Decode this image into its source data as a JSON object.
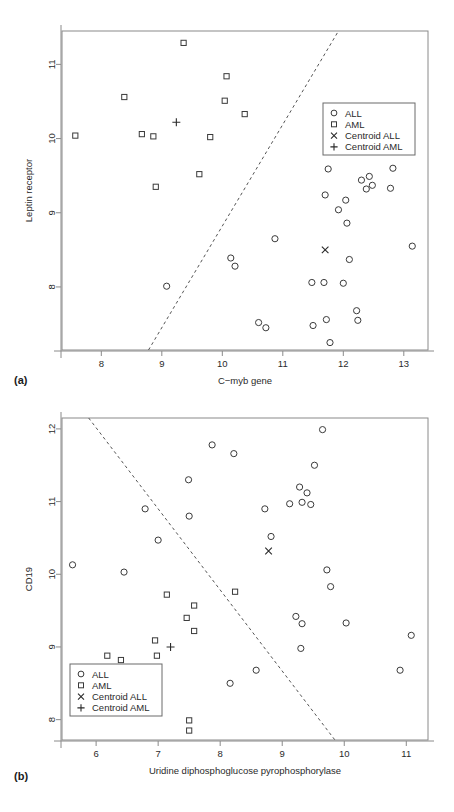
{
  "figure": {
    "panel_a_label": "(a)",
    "panel_b_label": "(b)"
  },
  "legend": {
    "items": [
      {
        "symbol": "circle",
        "label": "ALL"
      },
      {
        "symbol": "square",
        "label": "AML"
      },
      {
        "symbol": "cross",
        "label": "Centroid ALL"
      },
      {
        "symbol": "plus",
        "label": "Centroid AML"
      }
    ]
  },
  "colors": {
    "point_stroke": "#3a3a3a",
    "frame": "#8a8a8a",
    "boundary": "#555555",
    "text": "#2a2a2a"
  },
  "chart_data": [
    {
      "type": "scatter",
      "panel": "(a)",
      "title": "",
      "xlabel": "C−myb gene",
      "ylabel": "Leptin receptor",
      "xlim": [
        7.35,
        13.4
      ],
      "ylim": [
        7.15,
        11.45
      ],
      "xticks": [
        8,
        9,
        10,
        11,
        12,
        13
      ],
      "yticks": [
        8,
        9,
        10,
        11
      ],
      "grid": false,
      "legend_position": "top-right",
      "series": [
        {
          "name": "ALL",
          "symbol": "circle",
          "points": [
            [
              9.08,
              8.01
            ],
            [
              10.14,
              8.39
            ],
            [
              10.21,
              8.28
            ],
            [
              10.6,
              7.52
            ],
            [
              10.72,
              7.45
            ],
            [
              10.87,
              8.65
            ],
            [
              11.48,
              8.06
            ],
            [
              11.5,
              7.48
            ],
            [
              11.68,
              8.06
            ],
            [
              11.72,
              7.56
            ],
            [
              11.75,
              9.59
            ],
            [
              11.7,
              9.24
            ],
            [
              11.78,
              7.25
            ],
            [
              11.92,
              9.04
            ],
            [
              12.0,
              8.05
            ],
            [
              12.04,
              9.17
            ],
            [
              12.06,
              8.86
            ],
            [
              12.1,
              8.37
            ],
            [
              12.22,
              7.68
            ],
            [
              12.24,
              7.55
            ],
            [
              12.3,
              9.44
            ],
            [
              12.38,
              9.32
            ],
            [
              12.43,
              9.49
            ],
            [
              12.48,
              9.37
            ],
            [
              12.78,
              9.33
            ],
            [
              12.82,
              9.6
            ],
            [
              13.14,
              8.55
            ]
          ]
        },
        {
          "name": "AML",
          "symbol": "square",
          "points": [
            [
              7.57,
              10.04
            ],
            [
              8.38,
              10.56
            ],
            [
              8.67,
              10.06
            ],
            [
              8.86,
              10.03
            ],
            [
              8.9,
              9.35
            ],
            [
              9.36,
              11.29
            ],
            [
              9.62,
              9.52
            ],
            [
              9.8,
              10.02
            ],
            [
              10.04,
              10.51
            ],
            [
              10.07,
              10.84
            ],
            [
              10.37,
              10.33
            ]
          ]
        },
        {
          "name": "Centroid ALL",
          "symbol": "cross",
          "points": [
            [
              11.7,
              8.5
            ]
          ]
        },
        {
          "name": "Centroid AML",
          "symbol": "plus",
          "points": [
            [
              9.24,
              10.22
            ]
          ]
        }
      ],
      "decision_boundary": {
        "style": "dashed",
        "x": [
          8.78,
          11.92
        ],
        "y": [
          7.15,
          11.45
        ]
      }
    },
    {
      "type": "scatter",
      "panel": "(b)",
      "title": "",
      "xlabel": "Uridine diphosphoglucose pyrophosphorylase",
      "ylabel": "CD19",
      "xlim": [
        5.45,
        11.35
      ],
      "ylim": [
        7.72,
        12.15
      ],
      "xticks": [
        6,
        7,
        8,
        9,
        10,
        11
      ],
      "yticks": [
        8,
        9,
        10,
        11,
        12
      ],
      "grid": false,
      "legend_position": "bottom-left",
      "series": [
        {
          "name": "ALL",
          "symbol": "circle",
          "points": [
            [
              5.62,
              10.13
            ],
            [
              6.45,
              10.03
            ],
            [
              6.79,
              10.9
            ],
            [
              7.0,
              10.47
            ],
            [
              7.49,
              11.3
            ],
            [
              7.5,
              10.8
            ],
            [
              7.87,
              11.78
            ],
            [
              8.16,
              8.5
            ],
            [
              8.22,
              11.66
            ],
            [
              8.58,
              8.68
            ],
            [
              8.72,
              10.9
            ],
            [
              8.82,
              10.52
            ],
            [
              9.12,
              10.97
            ],
            [
              9.22,
              9.42
            ],
            [
              9.28,
              11.2
            ],
            [
              9.32,
              10.99
            ],
            [
              9.32,
              9.32
            ],
            [
              9.3,
              8.98
            ],
            [
              9.4,
              11.12
            ],
            [
              9.46,
              10.96
            ],
            [
              9.52,
              11.5
            ],
            [
              9.65,
              11.99
            ],
            [
              9.72,
              10.06
            ],
            [
              9.78,
              9.83
            ],
            [
              10.03,
              9.33
            ],
            [
              10.9,
              8.68
            ],
            [
              11.08,
              9.16
            ]
          ]
        },
        {
          "name": "AML",
          "symbol": "square",
          "points": [
            [
              6.18,
              8.88
            ],
            [
              6.4,
              8.82
            ],
            [
              6.95,
              9.09
            ],
            [
              6.98,
              8.88
            ],
            [
              7.14,
              9.72
            ],
            [
              7.46,
              9.4
            ],
            [
              7.5,
              7.99
            ],
            [
              7.5,
              7.85
            ],
            [
              7.58,
              9.57
            ],
            [
              7.58,
              9.22
            ],
            [
              8.24,
              9.76
            ]
          ]
        },
        {
          "name": "Centroid ALL",
          "symbol": "cross",
          "points": [
            [
              8.78,
              10.32
            ]
          ]
        },
        {
          "name": "Centroid AML",
          "symbol": "plus",
          "points": [
            [
              7.2,
              9.0
            ]
          ]
        }
      ],
      "decision_boundary": {
        "style": "dashed",
        "x": [
          5.88,
          9.85
        ],
        "y": [
          12.15,
          7.72
        ]
      }
    }
  ]
}
